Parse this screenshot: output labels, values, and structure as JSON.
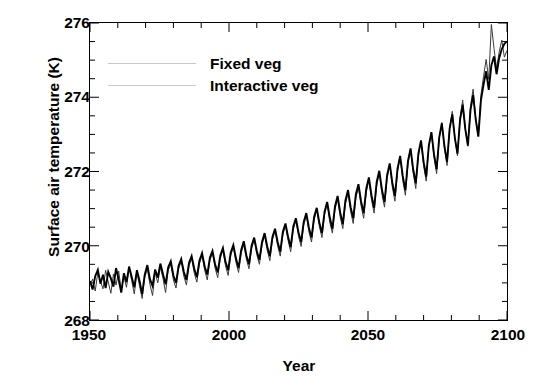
{
  "chart_data": {
    "type": "line",
    "title": "",
    "xlabel": "Year",
    "ylabel": "Surface air temperature (K)",
    "xlim": [
      1950,
      2100
    ],
    "ylim": [
      268,
      276
    ],
    "xticks": [
      1950,
      2000,
      2050,
      2100
    ],
    "yticks": [
      268,
      270,
      272,
      274,
      276
    ],
    "x_minor_tick_step": 10,
    "y_minor_tick_step": 0.5,
    "grid": false,
    "legend_position": "upper-left-inside",
    "series": [
      {
        "name": "Fixed veg",
        "color": "#000000",
        "line_width": 1.9,
        "values": [
          269.05,
          268.82,
          269.18,
          269.35,
          268.98,
          269.22,
          268.86,
          269.3,
          269.12,
          268.9,
          269.4,
          269.08,
          268.74,
          269.26,
          269.02,
          269.44,
          269.16,
          268.88,
          269.34,
          269.06,
          268.7,
          269.22,
          269.48,
          269.1,
          268.92,
          269.36,
          269.14,
          269.52,
          269.24,
          268.96,
          269.42,
          269.58,
          269.2,
          269.0,
          269.46,
          269.64,
          269.3,
          269.08,
          269.54,
          269.72,
          269.38,
          269.15,
          269.6,
          269.8,
          269.44,
          269.22,
          269.68,
          269.86,
          269.5,
          269.28,
          269.74,
          269.94,
          269.56,
          269.34,
          269.82,
          270.02,
          269.66,
          269.4,
          269.88,
          270.12,
          269.74,
          269.5,
          270.0,
          270.22,
          269.86,
          269.62,
          270.1,
          270.34,
          269.98,
          269.72,
          270.24,
          270.46,
          270.1,
          269.84,
          270.38,
          270.6,
          270.24,
          269.96,
          270.52,
          270.74,
          270.36,
          270.1,
          270.64,
          270.88,
          270.48,
          270.22,
          270.78,
          271.02,
          270.62,
          270.34,
          270.92,
          271.18,
          270.76,
          270.46,
          271.06,
          271.34,
          270.9,
          270.58,
          271.22,
          271.5,
          271.04,
          270.74,
          271.38,
          271.66,
          271.2,
          270.88,
          271.54,
          271.84,
          271.36,
          271.02,
          271.72,
          272.02,
          271.52,
          271.18,
          271.9,
          272.22,
          271.7,
          271.34,
          272.08,
          272.42,
          271.88,
          271.5,
          272.28,
          272.62,
          272.06,
          271.68,
          272.48,
          272.84,
          272.26,
          271.86,
          272.7,
          273.06,
          272.46,
          272.06,
          272.92,
          273.3,
          272.68,
          272.26,
          273.16,
          273.54,
          272.9,
          272.48,
          273.4,
          273.8,
          273.14,
          272.7,
          273.66,
          274.06,
          273.4,
          272.94,
          273.92,
          274.34,
          274.7,
          274.2,
          274.86,
          275.1,
          274.62,
          275.06,
          275.3,
          275.44,
          275.5
        ]
      },
      {
        "name": "Interactive veg",
        "color": "#3a3a3a",
        "line_width": 1.0,
        "values": [
          268.95,
          269.1,
          268.78,
          269.28,
          269.04,
          268.84,
          269.34,
          269.02,
          268.72,
          269.24,
          268.94,
          269.32,
          268.8,
          269.18,
          268.88,
          269.4,
          269.06,
          268.7,
          269.3,
          268.92,
          268.58,
          269.14,
          269.38,
          268.96,
          268.66,
          269.28,
          269.0,
          269.42,
          269.12,
          268.74,
          269.34,
          269.5,
          269.08,
          268.86,
          269.38,
          269.58,
          269.18,
          268.94,
          269.46,
          269.66,
          269.26,
          269.02,
          269.52,
          269.74,
          269.34,
          269.08,
          269.6,
          269.8,
          269.4,
          269.14,
          269.66,
          269.88,
          269.46,
          269.2,
          269.74,
          269.96,
          269.56,
          269.28,
          269.8,
          270.04,
          269.64,
          269.38,
          269.92,
          270.16,
          269.76,
          269.5,
          270.02,
          270.28,
          269.88,
          269.6,
          270.16,
          270.4,
          270.0,
          269.72,
          270.3,
          270.54,
          270.14,
          269.84,
          270.44,
          270.68,
          270.26,
          269.98,
          270.56,
          270.82,
          270.38,
          270.1,
          270.7,
          270.96,
          270.52,
          270.22,
          270.84,
          271.12,
          270.64,
          270.34,
          270.98,
          271.26,
          270.78,
          270.46,
          271.12,
          271.42,
          270.92,
          270.6,
          271.28,
          271.58,
          271.08,
          270.74,
          271.44,
          271.76,
          271.24,
          270.88,
          271.62,
          271.96,
          271.4,
          271.04,
          271.82,
          272.18,
          271.58,
          271.2,
          272.0,
          272.38,
          271.76,
          271.36,
          272.2,
          272.58,
          271.96,
          271.54,
          272.42,
          272.8,
          272.16,
          271.74,
          272.66,
          273.04,
          272.38,
          271.94,
          272.9,
          273.32,
          272.62,
          272.16,
          273.18,
          273.62,
          272.9,
          272.42,
          273.46,
          273.92,
          273.16,
          272.68,
          273.76,
          274.22,
          273.44,
          272.96,
          274.06,
          274.56,
          275.02,
          274.48,
          275.96,
          275.32,
          274.78,
          275.22,
          275.54,
          275.08,
          275.26
        ]
      }
    ],
    "annotations": {
      "start_year": 1950,
      "end_year": 2100,
      "n_points": 151,
      "description": "Annual global surface air temperature projections 1950-2100 for fixed vs interactive vegetation"
    }
  },
  "legend": {
    "entries": [
      {
        "label": "Fixed veg"
      },
      {
        "label": "Interactive veg"
      }
    ]
  },
  "axes": {
    "ytick_labels": [
      "276",
      "274",
      "272",
      "270",
      "268"
    ],
    "xtick_labels": [
      "1950",
      "2000",
      "2050",
      "2100"
    ],
    "ylabel": "Surface air temperature (K)",
    "xlabel": "Year"
  }
}
